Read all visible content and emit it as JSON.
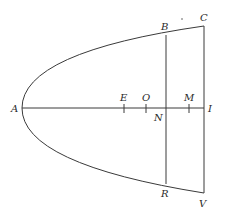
{
  "diagram": {
    "type": "parabola-geometry",
    "labels": {
      "A": "A",
      "B": "B",
      "C": "C",
      "E": "E",
      "O": "O",
      "M": "M",
      "N": "N",
      "I": "I",
      "R": "R",
      "V": "V"
    },
    "colors": {
      "stroke": "#3a3a3a",
      "text": "#2a2a2a",
      "background": "#ffffff"
    }
  }
}
